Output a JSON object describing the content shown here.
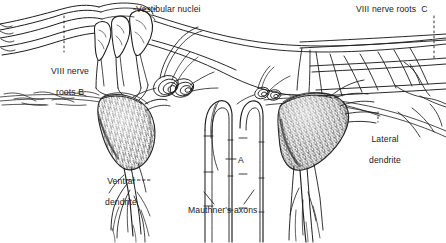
{
  "figure": {
    "style": "pen-and-ink stipple anatomical line drawing",
    "background_color": "#ffffff",
    "ink_color": "#1a1a1a",
    "width": 446,
    "height": 243
  },
  "labels": {
    "vestibular_nuclei": "Vestibular nuclei",
    "viii_nerve_roots_b_line1": "VIII nerve",
    "viii_nerve_roots_b_line2": "roots B",
    "viii_nerve_roots_c": "VIII nerve roots  C",
    "lateral_dendrite_line1": "Lateral",
    "lateral_dendrite_line2": "dendrite",
    "ventral_dendrite_line1": "Ventral",
    "ventral_dendrite_line2": "dendrite",
    "mauthners_axons": "Mauthner's axons",
    "marker_a": "A"
  },
  "structures": [
    {
      "name": "vestibular-nuclei",
      "label": "Vestibular nuclei",
      "leader": "dashed-horizontal",
      "position": "top-center"
    },
    {
      "name": "viii-nerve-roots-b",
      "label": "VIII nerve roots B",
      "leader": "dotted-vertical",
      "position": "upper-left"
    },
    {
      "name": "viii-nerve-roots-c",
      "label": "VIII nerve roots  C",
      "leader": "dotted-vertical",
      "position": "upper-right"
    },
    {
      "name": "left-mauthner-soma",
      "label": "",
      "leader": "none",
      "position": "left-center"
    },
    {
      "name": "right-mauthner-soma",
      "label": "",
      "leader": "none",
      "position": "right-center"
    },
    {
      "name": "lateral-dendrite",
      "label": "Lateral dendrite",
      "leader": "dotted-vertical",
      "position": "right-center"
    },
    {
      "name": "ventral-dendrite",
      "label": "Ventral dendrite",
      "leader": "dashed-horizontal",
      "position": "lower-left"
    },
    {
      "name": "mauthners-axons",
      "label": "Mauthner's axons",
      "leader": "two-diagonal-lines",
      "position": "bottom-center"
    },
    {
      "name": "marker-a",
      "label": "A",
      "leader": "short-dash",
      "position": "center"
    },
    {
      "name": "axon-cap-spiral-left",
      "label": "",
      "leader": "none",
      "position": "center-left"
    },
    {
      "name": "axon-cap-spiral-right",
      "label": "",
      "leader": "none",
      "position": "center-right"
    },
    {
      "name": "horizontal-fiber-tracts",
      "label": "",
      "leader": "none",
      "position": "right-band"
    }
  ]
}
